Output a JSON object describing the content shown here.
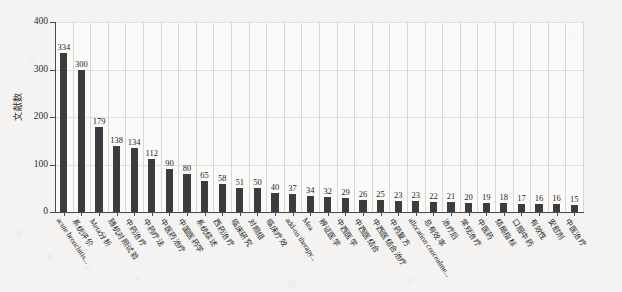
{
  "chart_data": {
    "type": "bar",
    "title": "",
    "xlabel": "",
    "ylabel": "文献数",
    "ylim": [
      0,
      400
    ],
    "yticks": [
      0,
      100,
      200,
      300,
      400
    ],
    "grid": true,
    "legend": null,
    "bar_color": "#3c3c3c",
    "categories": [
      "acute bronchitis...",
      "系统评价",
      "Meta分析",
      "随机对照试验",
      "中药治疗",
      "中药疗法",
      "中医药治疗",
      "中国医药学",
      "系统综述",
      "西药治疗",
      "临床研究",
      "对照组",
      "临床疗效",
      "add-on therapy...",
      "Mea",
      "辨证医学",
      "中西医学",
      "中西医结合",
      "中西医结合治疗",
      "中药复方",
      "allocation concealme...",
      "总有效率",
      "治疗后",
      "常规治疗",
      "中医药",
      "结局指标",
      "口服中药",
      "有效性",
      "安慰剂",
      "中医治疗"
    ],
    "values": [
      334,
      300,
      179,
      138,
      134,
      112,
      90,
      80,
      65,
      58,
      51,
      50,
      40,
      37,
      34,
      32,
      29,
      26,
      25,
      23,
      23,
      22,
      21,
      20,
      19,
      18,
      17,
      16,
      16,
      15
    ]
  },
  "axis": {
    "y_title": "文献数"
  }
}
